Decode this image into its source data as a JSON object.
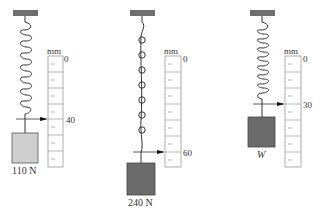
{
  "diagram": {
    "unit": "mm",
    "colors": {
      "ceiling": "#6e6e6e",
      "block_light": "#cfcfcf",
      "block_dark": "#6b6b6b",
      "line": "#333333",
      "scale_border": "#999999"
    },
    "panels": [
      {
        "id": "panel-1",
        "scale_zero": "0",
        "reading": "40",
        "weight_label": "110 N",
        "coil_turns": 8
      },
      {
        "id": "panel-2",
        "scale_zero": "0",
        "reading": "60",
        "weight_label": "240 N",
        "coil_turns": 7
      },
      {
        "id": "panel-3",
        "scale_zero": "0",
        "reading": "30",
        "weight_label": "W",
        "coil_turns": 8
      }
    ]
  }
}
